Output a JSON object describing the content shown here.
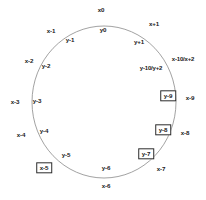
{
  "figure": {
    "kind": "ring-diagram",
    "background_color": "#ffffff",
    "ring_stroke_color": "#8a8a8a",
    "ring_stroke_width": 0.8,
    "label_color": "#1a1a1a",
    "box_border_color": "#2b2b2b",
    "box_fill_color": "#ffffff"
  },
  "chart_data": {
    "type": "scatter",
    "title": "",
    "subtitle": "",
    "xlabel": "",
    "ylabel": "",
    "grid": false,
    "legend": "none",
    "circle": {
      "center_x": 104,
      "center_y": 102,
      "radius_x": 72,
      "radius_y": 76
    },
    "series": [
      {
        "name": "outer-x-labels",
        "radius": "outer",
        "values": [
          "x0",
          "x+1",
          "x-10/x+2",
          "x-9",
          "x-8",
          "x-7",
          "x-6",
          "x-5",
          "x-4",
          "x-3",
          "x-2",
          "x-1"
        ]
      },
      {
        "name": "inner-y-labels",
        "radius": "inner",
        "values": [
          "y0",
          "y+1",
          "y-10/y+2",
          "y-9",
          "y-8",
          "y-7",
          "y-6",
          "y-5",
          "y-4",
          "y-3",
          "y-2",
          "y-1"
        ]
      }
    ],
    "nodes": [
      {
        "id": "x0",
        "label": "x0",
        "ring": "outer",
        "boxed": false,
        "x": 101,
        "y": 10,
        "wide": false
      },
      {
        "id": "x-plus-1",
        "label": "x+1",
        "ring": "outer",
        "boxed": false,
        "x": 154,
        "y": 24,
        "wide": false
      },
      {
        "id": "x-10-x-2",
        "label": "x-10/x+2",
        "ring": "outer",
        "boxed": false,
        "x": 183,
        "y": 59,
        "wide": true
      },
      {
        "id": "x-9",
        "label": "x-9",
        "ring": "outer",
        "boxed": false,
        "x": 190,
        "y": 98,
        "wide": false
      },
      {
        "id": "x-8",
        "label": "x-8",
        "ring": "outer",
        "boxed": false,
        "x": 185,
        "y": 133,
        "wide": false
      },
      {
        "id": "x-7",
        "label": "x-7",
        "ring": "outer",
        "boxed": false,
        "x": 161,
        "y": 169,
        "wide": false
      },
      {
        "id": "x-6",
        "label": "x-6",
        "ring": "outer",
        "boxed": false,
        "x": 106,
        "y": 186,
        "wide": false
      },
      {
        "id": "x-5",
        "label": "x-5",
        "ring": "outer",
        "boxed": true,
        "x": 44,
        "y": 168,
        "wide": false
      },
      {
        "id": "x-4",
        "label": "x-4",
        "ring": "outer",
        "boxed": false,
        "x": 21,
        "y": 135,
        "wide": false
      },
      {
        "id": "x-3",
        "label": "x-3",
        "ring": "outer",
        "boxed": false,
        "x": 15,
        "y": 102,
        "wide": false
      },
      {
        "id": "x-2",
        "label": "x-2",
        "ring": "outer",
        "boxed": false,
        "x": 29,
        "y": 61,
        "wide": false
      },
      {
        "id": "x-1",
        "label": "x-1",
        "ring": "outer",
        "boxed": false,
        "x": 51,
        "y": 31,
        "wide": false
      },
      {
        "id": "y0",
        "label": "y0",
        "ring": "inner",
        "boxed": false,
        "x": 103,
        "y": 30,
        "wide": false
      },
      {
        "id": "y-plus-1",
        "label": "y+1",
        "ring": "inner",
        "boxed": false,
        "x": 139,
        "y": 42,
        "wide": false
      },
      {
        "id": "y-10-y-2",
        "label": "y-10/y+2",
        "ring": "inner",
        "boxed": false,
        "x": 151,
        "y": 68,
        "wide": true
      },
      {
        "id": "y-9",
        "label": "y-9",
        "ring": "inner",
        "boxed": true,
        "x": 168,
        "y": 96,
        "wide": false
      },
      {
        "id": "y-8",
        "label": "y-8",
        "ring": "inner",
        "boxed": true,
        "x": 163,
        "y": 130,
        "wide": false
      },
      {
        "id": "y-7",
        "label": "y-7",
        "ring": "inner",
        "boxed": true,
        "x": 146,
        "y": 154,
        "wide": false
      },
      {
        "id": "y-6",
        "label": "y-6",
        "ring": "inner",
        "boxed": false,
        "x": 106,
        "y": 168,
        "wide": false
      },
      {
        "id": "y-5",
        "label": "y-5",
        "ring": "inner",
        "boxed": false,
        "x": 66,
        "y": 155,
        "wide": false
      },
      {
        "id": "y-4",
        "label": "y-4",
        "ring": "inner",
        "boxed": false,
        "x": 44,
        "y": 131,
        "wide": false
      },
      {
        "id": "y-3",
        "label": "y-3",
        "ring": "inner",
        "boxed": false,
        "x": 37,
        "y": 101,
        "wide": false
      },
      {
        "id": "y-2",
        "label": "y-2",
        "ring": "inner",
        "boxed": false,
        "x": 46,
        "y": 66,
        "wide": false
      },
      {
        "id": "y-1",
        "label": "y-1",
        "ring": "inner",
        "boxed": false,
        "x": 70,
        "y": 40,
        "wide": false
      }
    ]
  }
}
